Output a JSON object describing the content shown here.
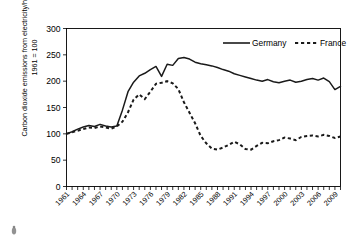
{
  "chart_data": {
    "type": "line",
    "title": "",
    "xlabel": "",
    "ylabel_line1": "Carbon dioxide emissions from electricity/heating,",
    "ylabel_line2": "1961 = 100",
    "ylim": [
      0,
      300
    ],
    "yticks": [
      0,
      50,
      100,
      150,
      200,
      250,
      300
    ],
    "xlim": [
      1961,
      2010
    ],
    "xticks": [
      1961,
      1964,
      1967,
      1970,
      1973,
      1976,
      1979,
      1982,
      1985,
      1988,
      1991,
      1994,
      1997,
      2000,
      2003,
      2006,
      2009
    ],
    "grid": false,
    "legend_position": "top-right",
    "x": [
      1961,
      1962,
      1963,
      1964,
      1965,
      1966,
      1967,
      1968,
      1969,
      1970,
      1971,
      1972,
      1973,
      1974,
      1975,
      1976,
      1977,
      1978,
      1979,
      1980,
      1981,
      1982,
      1983,
      1984,
      1985,
      1986,
      1987,
      1988,
      1989,
      1990,
      1991,
      1992,
      1993,
      1994,
      1995,
      1996,
      1997,
      1998,
      1999,
      2000,
      2001,
      2002,
      2003,
      2004,
      2005,
      2006,
      2007,
      2008,
      2009,
      2010
    ],
    "series": [
      {
        "name": "Germany",
        "style": "solid",
        "color": "#1a1a1a",
        "values": [
          100,
          104,
          109,
          113,
          116,
          114,
          118,
          115,
          113,
          115,
          145,
          180,
          198,
          210,
          215,
          222,
          228,
          209,
          232,
          230,
          243,
          245,
          242,
          236,
          233,
          231,
          229,
          226,
          222,
          219,
          214,
          211,
          208,
          205,
          202,
          200,
          203,
          199,
          197,
          200,
          202,
          198,
          200,
          203,
          205,
          202,
          206,
          199,
          184,
          190
        ]
      },
      {
        "name": "France",
        "style": "dashed",
        "color": "#1a1a1a",
        "values": [
          100,
          103,
          106,
          109,
          112,
          111,
          114,
          112,
          110,
          114,
          123,
          141,
          165,
          175,
          166,
          180,
          195,
          197,
          200,
          196,
          185,
          160,
          140,
          120,
          96,
          82,
          72,
          70,
          74,
          79,
          85,
          80,
          71,
          70,
          77,
          83,
          82,
          86,
          88,
          93,
          91,
          88,
          94,
          96,
          97,
          95,
          98,
          96,
          92,
          95
        ]
      }
    ],
    "legend": [
      {
        "label": "Germany",
        "style": "solid"
      },
      {
        "label": "France",
        "style": "dashed"
      }
    ]
  }
}
